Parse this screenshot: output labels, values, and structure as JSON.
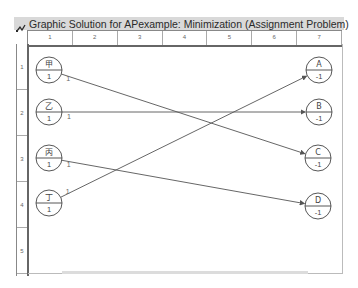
{
  "window": {
    "title": "Graphic Solution for APexample: Minimization (Assignment Problem)",
    "icon": "network-graph-icon"
  },
  "grid": {
    "columns": [
      "1",
      "2",
      "3",
      "4",
      "5",
      "6",
      "7"
    ],
    "rows": [
      "1",
      "2",
      "3",
      "4",
      "5"
    ]
  },
  "nodes": [
    {
      "id": "jia",
      "label": "甲",
      "value": "1",
      "cx": 49,
      "cy": 70
    },
    {
      "id": "yi",
      "label": "乙",
      "value": "1",
      "cx": 49,
      "cy": 112
    },
    {
      "id": "bing",
      "label": "丙",
      "value": "1",
      "cx": 49,
      "cy": 158
    },
    {
      "id": "ding",
      "label": "丁",
      "value": "1",
      "cx": 49,
      "cy": 203
    },
    {
      "id": "A",
      "label": "A",
      "value": "-1",
      "cx": 319,
      "cy": 70
    },
    {
      "id": "B",
      "label": "B",
      "value": "-1",
      "cx": 319,
      "cy": 112
    },
    {
      "id": "C",
      "label": "C",
      "value": "-1",
      "cx": 318,
      "cy": 158
    },
    {
      "id": "D",
      "label": "D",
      "value": "-1",
      "cx": 318,
      "cy": 206
    }
  ],
  "edges": [
    {
      "from": "jia",
      "to": "C",
      "flow": "1"
    },
    {
      "from": "yi",
      "to": "B",
      "flow": "1"
    },
    {
      "from": "bing",
      "to": "D",
      "flow": "1"
    },
    {
      "from": "ding",
      "to": "A",
      "flow": "1"
    }
  ],
  "colors": {
    "edge": "#555555",
    "node_stroke": "#444444",
    "text": "#444444",
    "titlebar": "#d9d9d9"
  }
}
